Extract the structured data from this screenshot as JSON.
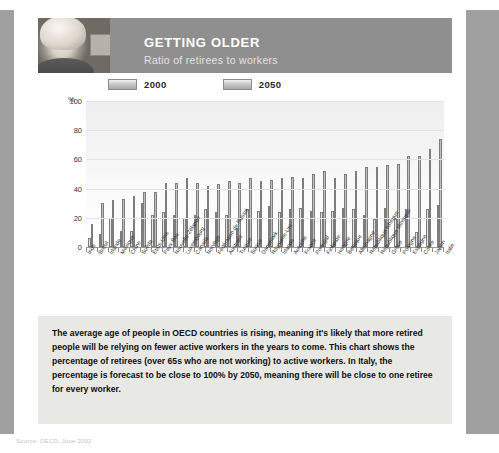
{
  "header": {
    "title": "GETTING OLDER",
    "subtitle": "Ratio of retirees to workers",
    "photo_alt": "older-woman-photo"
  },
  "legend": [
    {
      "label": "2000"
    },
    {
      "label": "2050"
    }
  ],
  "axis": {
    "unit": "%",
    "yticks": [
      "100",
      "80",
      "60",
      "40",
      "20",
      "0"
    ]
  },
  "body_text": "The average age of people in OECD countries is rising, meaning it's likely that more retired people will be relying on fewer active workers in the years to come. This chart shows the percentage of retirees (over 65s who are not working) to active workers. In Italy, the percentage is forecast to be close to 100% by 2050, meaning there will be close to one retiree for every worker.",
  "source": "Source: OECD, June 2002",
  "colors": {
    "header_band": "#8f8f8f",
    "page_margin": "#a0a0a0",
    "text_panel": "#e8e8e4",
    "bar_2000": "#d2d2d2",
    "bar_2050": "#9e9e9e"
  },
  "chart_data": {
    "type": "bar",
    "title": "Ratio of retirees to workers",
    "xlabel": "",
    "ylabel": "%",
    "ylim": [
      0,
      100
    ],
    "grid": true,
    "legend_position": "top-left",
    "categories": [
      "Inde",
      "Brésil",
      "Irlande",
      "Mexique",
      "Chine",
      "Suède",
      "États-Unis",
      "Pays-Bas",
      "Nouvelle-Zélande",
      "Luxembourg",
      "Canada",
      "Norvège",
      "Fédération de Russie",
      "Australie",
      "Turquie",
      "Suisse",
      "Danemark",
      "Royaume-Uni",
      "Irlande",
      "Autriche",
      "France",
      "Portugal",
      "Finlande",
      "Hongrie",
      "Belgique",
      "Allemagne",
      "République tchèque",
      "République slovaque",
      "Grèce",
      "Pologne",
      "Espagne",
      "Corée",
      "Japon",
      "Italie"
    ],
    "series": [
      {
        "name": "2000",
        "values": [
          6,
          9,
          20,
          11,
          11,
          30,
          22,
          24,
          22,
          20,
          22,
          26,
          24,
          22,
          13,
          26,
          25,
          28,
          24,
          26,
          27,
          25,
          24,
          25,
          27,
          26,
          22,
          19,
          27,
          19,
          26,
          10,
          26,
          29
        ]
      },
      {
        "name": "2050",
        "values": [
          16,
          30,
          32,
          33,
          35,
          38,
          38,
          44,
          44,
          47,
          44,
          42,
          43,
          45,
          44,
          47,
          45,
          46,
          47,
          48,
          47,
          50,
          52,
          47,
          50,
          52,
          55,
          55,
          56,
          57,
          62,
          62,
          67,
          74
        ]
      }
    ]
  }
}
